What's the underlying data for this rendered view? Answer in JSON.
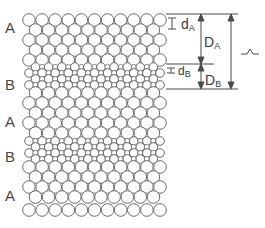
{
  "diagram": {
    "layer_labels": [
      {
        "text": "A",
        "y": 28
      },
      {
        "text": "B",
        "y": 85
      },
      {
        "text": "A",
        "y": 122
      },
      {
        "text": "B",
        "y": 157
      },
      {
        "text": "A",
        "y": 196
      }
    ],
    "layer_sequence": [
      "A",
      "B",
      "A",
      "B",
      "A"
    ],
    "layers": [
      {
        "type": "A",
        "rows": [
          20,
          30,
          40,
          50,
          60
        ]
      },
      {
        "type": "B",
        "rows": [
          67,
          73,
          79,
          85
        ]
      },
      {
        "type": "A",
        "rows": [
          93,
          103,
          113,
          123,
          133
        ]
      },
      {
        "type": "B",
        "rows": [
          141,
          147,
          153,
          159
        ]
      },
      {
        "type": "A",
        "rows": [
          167,
          177,
          187,
          197,
          210
        ]
      }
    ],
    "circles": {
      "A": {
        "radius": 6.3,
        "spacing": 13.1,
        "count_per_row": 11,
        "x_start": 29
      },
      "B": {
        "radius": 4.3,
        "spacing": 13.1,
        "count_per_row": 11,
        "x_start": 29
      },
      "stroke_color": "#6b6b6b"
    },
    "annotations": {
      "dA": {
        "main": "d",
        "sub": "A"
      },
      "DA": {
        "main": "D",
        "sub": "A"
      },
      "dB": {
        "main": "d",
        "sub": "B"
      },
      "DB": {
        "main": "D",
        "sub": "B"
      },
      "period": {
        "symbol": "Λ"
      }
    },
    "line_color": "#4a4a4a"
  }
}
